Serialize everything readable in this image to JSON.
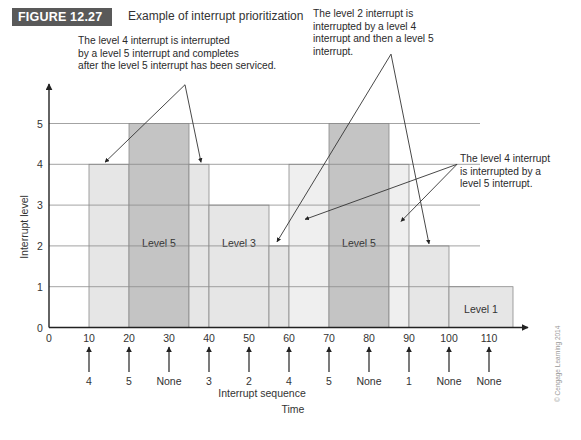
{
  "figure": {
    "badge": "FIGURE 12.27",
    "title": "Example of interrupt prioritization",
    "copyright": "© Cengage Learning 2014",
    "badge_color": "#595959"
  },
  "chart_data": {
    "type": "bar",
    "title": "Example of interrupt prioritization",
    "xlabel": "Time",
    "ylabel": "Interrupt level",
    "sequence_label": "Interrupt sequence",
    "xlim": [
      0,
      120
    ],
    "ylim": [
      0,
      5
    ],
    "x_ticks": [
      0,
      10,
      20,
      30,
      40,
      50,
      60,
      70,
      80,
      90,
      100,
      110
    ],
    "y_ticks": [
      0,
      1,
      2,
      3,
      4,
      5
    ],
    "grid": true,
    "segments": [
      {
        "start": 10,
        "end": 20,
        "level": 4,
        "shade": "light"
      },
      {
        "start": 20,
        "end": 35,
        "level": 5,
        "shade": "dark",
        "label": "Level 5"
      },
      {
        "start": 35,
        "end": 40,
        "level": 4,
        "shade": "light"
      },
      {
        "start": 40,
        "end": 55,
        "level": 3,
        "shade": "light",
        "label": "Level 3"
      },
      {
        "start": 55,
        "end": 60,
        "level": 2,
        "shade": "light"
      },
      {
        "start": 60,
        "end": 70,
        "level": 4,
        "shade": "lighter"
      },
      {
        "start": 70,
        "end": 85,
        "level": 5,
        "shade": "dark",
        "label": "Level 5"
      },
      {
        "start": 85,
        "end": 90,
        "level": 4,
        "shade": "lighter"
      },
      {
        "start": 90,
        "end": 100,
        "level": 2,
        "shade": "light"
      },
      {
        "start": 100,
        "end": 116,
        "level": 1,
        "shade": "light",
        "label": "Level 1"
      }
    ],
    "interrupt_sequence": [
      {
        "time": 10,
        "label": "4"
      },
      {
        "time": 20,
        "label": "5"
      },
      {
        "time": 30,
        "label": "None"
      },
      {
        "time": 40,
        "label": "3"
      },
      {
        "time": 50,
        "label": "2"
      },
      {
        "time": 60,
        "label": "4"
      },
      {
        "time": 70,
        "label": "5"
      },
      {
        "time": 80,
        "label": "None"
      },
      {
        "time": 90,
        "label": "1"
      },
      {
        "time": 100,
        "label": "None"
      },
      {
        "time": 110,
        "label": "None"
      }
    ],
    "shades": {
      "light": "#e6e6e6",
      "lighter": "#efefef",
      "dark": "#c4c4c4"
    },
    "annotations": [
      {
        "lines": [
          "The level 4 interrupt is interrupted",
          "by a level 5 interrupt and completes",
          "after the level 5 interrupt has been serviced."
        ],
        "apex": [
          34,
          5.95
        ],
        "targets": [
          [
            14,
            4.05
          ],
          [
            38,
            4.05
          ]
        ]
      },
      {
        "lines": [
          "The level 2 interrupt is",
          "interrupted by a level 4",
          "interrupt and then a level 5",
          "interrupt."
        ],
        "apex": [
          85.5,
          6.7
        ],
        "targets": [
          [
            57,
            2.1
          ],
          [
            95,
            2.05
          ]
        ]
      },
      {
        "lines": [
          "The level 4 interrupt",
          "is interrupted by a",
          "level 5 interrupt."
        ],
        "apex": [
          102,
          4.0
        ],
        "targets": [
          [
            64,
            2.65
          ],
          [
            88,
            2.6
          ]
        ]
      }
    ]
  }
}
